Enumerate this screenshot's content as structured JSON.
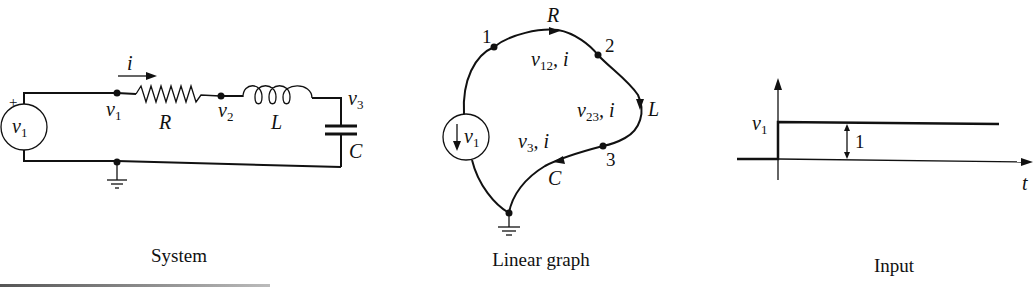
{
  "panels": {
    "system": {
      "caption": "System",
      "source_label": "v",
      "source_sub": "1",
      "plus_sign": "+",
      "current_label": "i",
      "node_v1": "v",
      "node_v1_sub": "1",
      "node_v2": "v",
      "node_v2_sub": "2",
      "node_v3": "v",
      "node_v3_sub": "3",
      "resistor_label": "R",
      "inductor_label": "L",
      "capacitor_label": "C"
    },
    "linear_graph": {
      "caption": "Linear graph",
      "node_1": "1",
      "node_2": "2",
      "node_3": "3",
      "source_label": "v",
      "source_sub": "1",
      "edge_R_label": "R",
      "edge_L_label": "L",
      "edge_C_label": "C",
      "edge_12_label": "v",
      "edge_12_sub": "12",
      "edge_12_current": ", i",
      "edge_23_label": "v",
      "edge_23_sub": "23",
      "edge_23_current": ", i",
      "edge_3_label": "v",
      "edge_3_sub": "3",
      "edge_3_current": ", i"
    },
    "input": {
      "caption": "Input",
      "y_label": "v",
      "y_sub": "1",
      "x_label": "t",
      "step_height": "1"
    }
  }
}
